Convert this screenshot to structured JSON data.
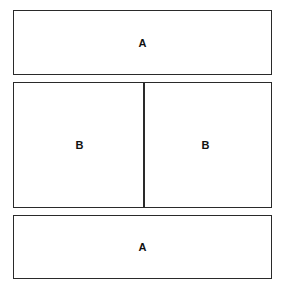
{
  "diagram": {
    "top_box": {
      "label": "A"
    },
    "middle_box": {
      "left_label": "B",
      "right_label": "B"
    },
    "bottom_box": {
      "label": "A"
    }
  }
}
